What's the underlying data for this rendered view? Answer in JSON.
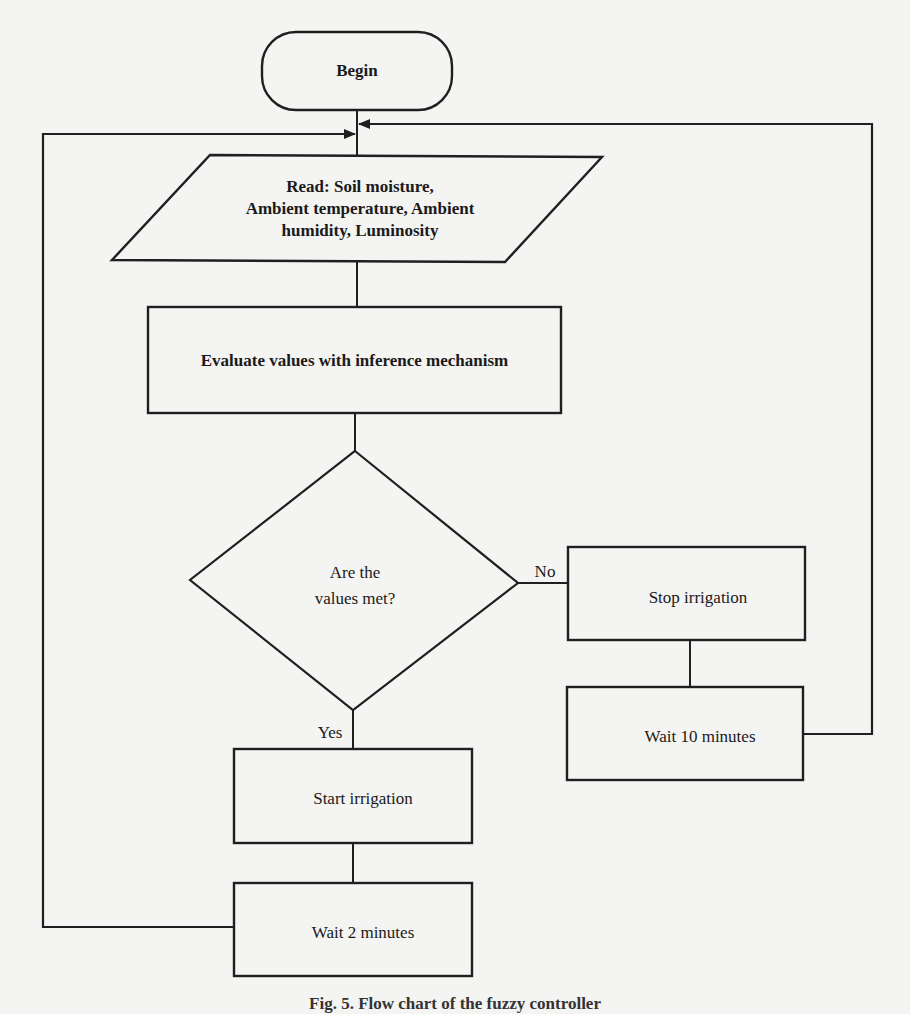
{
  "diagram": {
    "type": "flowchart",
    "nodes": {
      "begin": {
        "shape": "terminal",
        "label": "Begin"
      },
      "read": {
        "shape": "parallelogram",
        "lines": [
          "Read: Soil moisture,",
          "Ambient temperature, Ambient",
          "humidity, Luminosity"
        ]
      },
      "evaluate": {
        "shape": "rectangle",
        "label": "Evaluate values with inference mechanism"
      },
      "decision": {
        "shape": "diamond",
        "lines": [
          "Are the",
          "values met?"
        ]
      },
      "stop_irrigation": {
        "shape": "rectangle",
        "label": "Stop irrigation"
      },
      "wait_10": {
        "shape": "rectangle",
        "label": "Wait 10 minutes"
      },
      "start_irrigation": {
        "shape": "rectangle",
        "label": "Start irrigation"
      },
      "wait_2": {
        "shape": "rectangle",
        "label": "Wait 2 minutes"
      }
    },
    "edges": {
      "no_label": "No",
      "yes_label": "Yes"
    },
    "flow": [
      "begin -> read",
      "read -> evaluate",
      "evaluate -> decision",
      "decision -(No)-> stop_irrigation",
      "stop_irrigation -> wait_10",
      "wait_10 -> read (loop back)",
      "decision -(Yes)-> start_irrigation",
      "start_irrigation -> wait_2",
      "wait_2 -> read (loop back)"
    ],
    "caption": "Fig. 5. Flow chart of the fuzzy controller"
  },
  "colors": {
    "background": "#f4f4f2",
    "stroke": "#1f1f1f",
    "text": "#1a1a1a"
  }
}
